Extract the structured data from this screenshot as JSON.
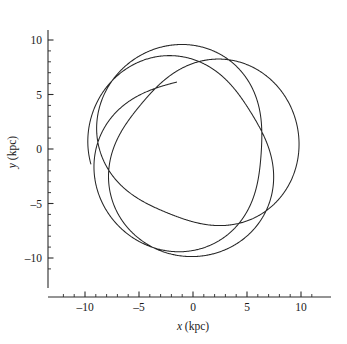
{
  "figure": {
    "background_color": "#ffffff",
    "line_color": "#262626",
    "axis_color": "#2b2b2b"
  },
  "axes": {
    "x_title_var": "x",
    "x_title_unit": " (kpc)",
    "y_title_var": "y",
    "y_title_unit": " (kpc)",
    "x_tick_labels": [
      "–10",
      "–5",
      "0",
      "5",
      "10"
    ],
    "y_tick_labels": [
      "10",
      "5",
      "0",
      "–5",
      "–10"
    ]
  },
  "chart_data": {
    "type": "line",
    "title": "",
    "xlabel": "x (kpc)",
    "ylabel": "y (kpc)",
    "xlim": [
      -12.2,
      11.8
    ],
    "ylim": [
      -11.8,
      11.6
    ],
    "xticks": [
      -10,
      -5,
      0,
      5,
      10
    ],
    "yticks": [
      -10,
      -5,
      0,
      5,
      10
    ],
    "x_minor_tick_step": 1,
    "y_minor_tick_step": 1,
    "grid": false,
    "legend": null,
    "series": [
      {
        "name": "rosette orbit",
        "description": "Precessing elliptical (rosette) orbit of a star in an axisymmetric galactic potential, traced over several radial oscillations.",
        "orbit_model": {
          "r_apocenter_kpc": 10.05,
          "r_pericenter_kpc": 6.5,
          "radial_periods_drawn": 4.62,
          "azimuthal_advance_per_radial_period_deg": 252.0,
          "initial_phase_deg": 104.0,
          "samples": 2600
        }
      }
    ]
  }
}
